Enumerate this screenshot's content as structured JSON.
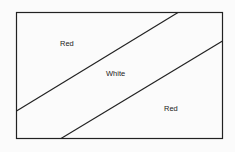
{
  "diagram": {
    "type": "flag-diagram",
    "regions": [
      {
        "id": "upper-left",
        "label": "Red"
      },
      {
        "id": "middle-band",
        "label": "White"
      },
      {
        "id": "lower-right",
        "label": "Red"
      }
    ]
  }
}
